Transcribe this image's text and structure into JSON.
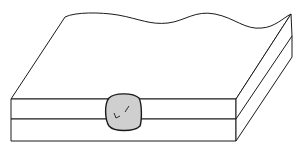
{
  "diagram": {
    "title": "Spot weld nugget between two lap-joined sheets",
    "colors": {
      "background": "#ffffff",
      "stroke": "#1a1a1a",
      "nugget_fill": "#cfcfcf"
    },
    "components": {
      "top_sheet": "upper sheet",
      "bottom_sheet": "lower sheet",
      "weld_nugget": "weld nugget"
    }
  }
}
